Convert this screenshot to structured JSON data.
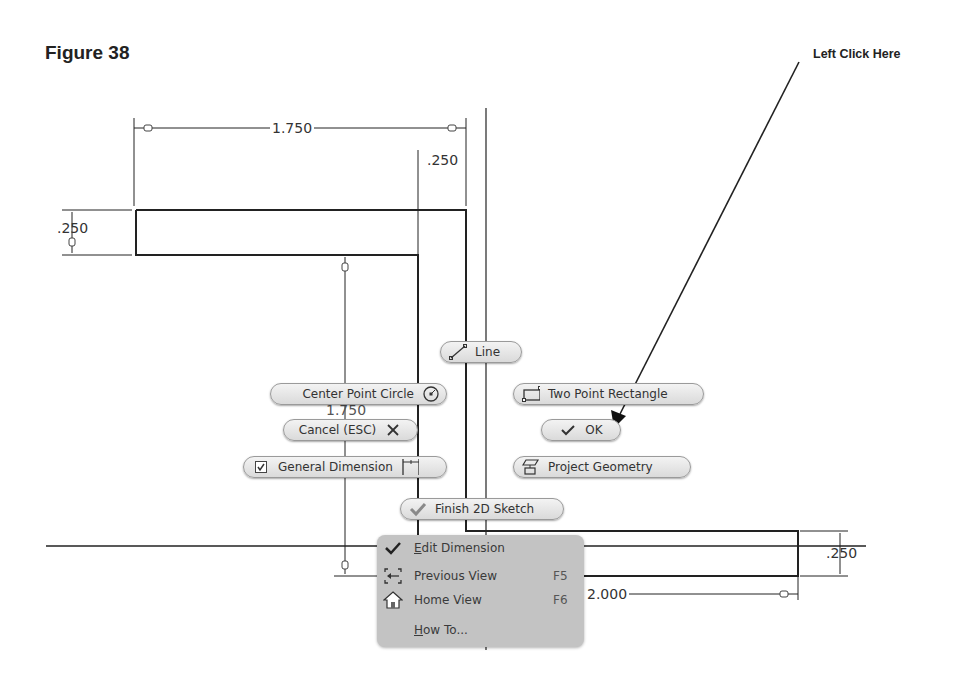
{
  "figure": {
    "title": "Figure 38",
    "callout": "Left Click Here"
  },
  "dimensions": {
    "top_width": "1.750",
    "top_offset": ".250",
    "left_height": ".250",
    "vertical": "1.750",
    "bottom_width": "2.000",
    "right_height": ".250"
  },
  "marking_menu": {
    "line": {
      "label": "Line",
      "icon": "line-icon"
    },
    "center_point_circle": {
      "label": "Center Point Circle",
      "icon": "circle-icon"
    },
    "two_point_rectangle": {
      "label": "Two Point Rectangle",
      "icon": "rectangle-icon"
    },
    "cancel": {
      "label": "Cancel (ESC)",
      "icon": "close-icon"
    },
    "ok": {
      "label": "OK",
      "icon": "check-icon"
    },
    "general_dimension": {
      "label": "General Dimension",
      "icon": "dimension-icon"
    },
    "project_geometry": {
      "label": "Project Geometry",
      "icon": "project-geometry-icon"
    },
    "finish_sketch": {
      "label": "Finish 2D Sketch",
      "icon": "check-icon"
    }
  },
  "context_menu": {
    "items": [
      {
        "label_first": "E",
        "label_rest": "dit Dimension",
        "shortcut": "",
        "icon": "check-icon"
      },
      {
        "label_first": "",
        "label_rest": "Previous View",
        "shortcut": "F5",
        "icon": "previous-view-icon"
      },
      {
        "label_first": "",
        "label_rest": "Home View",
        "shortcut": "F6",
        "icon": "home-icon"
      },
      {
        "label_first": "H",
        "label_rest": "ow To...",
        "shortcut": "",
        "icon": ""
      }
    ]
  }
}
